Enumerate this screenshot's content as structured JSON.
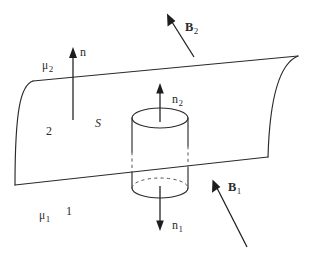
{
  "figure": {
    "geometry": {
      "surface": {
        "top_edge": {
          "x1": 33,
          "y1": 81,
          "x2": 298,
          "y2": 56
        },
        "bottom_edge": {
          "x1": 15,
          "y1": 185,
          "x2": 268,
          "y2": 157
        },
        "left_edge_curved": true,
        "right_edge_curved": true
      },
      "cylinder": {
        "center_x": 160,
        "radius_x": 28,
        "radius_y": 10,
        "top_y": 118,
        "bottom_y": 188
      }
    },
    "colors": {
      "ink": "#2a2a2a",
      "hidden_line": "#555555",
      "background": "#ffffff"
    }
  },
  "labels": {
    "mu_upper": {
      "base": "μ",
      "sub": "2"
    },
    "mu_lower": {
      "base": "μ",
      "sub": "1"
    },
    "region_upper": {
      "base": "2",
      "sub": ""
    },
    "region_lower": {
      "base": "1",
      "sub": ""
    },
    "surface": {
      "base": "S",
      "sub": ""
    },
    "normal_surface": {
      "base": "n",
      "sub": ""
    },
    "normal_upper": {
      "base": "n",
      "sub": "2"
    },
    "normal_lower": {
      "base": "n",
      "sub": "1"
    },
    "field_upper": {
      "base": "B",
      "sub": "2"
    },
    "field_lower": {
      "base": "B",
      "sub": "1"
    }
  },
  "vectors": {
    "normal_surface": {
      "from": [
        73,
        120
      ],
      "to": [
        73,
        50
      ],
      "direction": "up"
    },
    "normal_upper": {
      "from": [
        160,
        120
      ],
      "to": [
        160,
        85
      ],
      "direction": "up"
    },
    "normal_lower": {
      "from": [
        160,
        188
      ],
      "to": [
        160,
        231
      ],
      "direction": "down"
    },
    "field_upper": {
      "from": [
        194,
        57
      ],
      "to": [
        168,
        15
      ],
      "direction": "up-left"
    },
    "field_lower": {
      "from": [
        247,
        247
      ],
      "to": [
        213,
        180
      ],
      "direction": "up-left"
    }
  }
}
